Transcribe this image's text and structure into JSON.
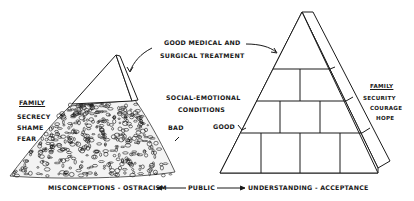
{
  "diagram": {
    "top_label": {
      "line1": "GOOD MEDICAL AND",
      "line2": "SURGICAL TREATMENT"
    },
    "center_label": {
      "line1": "SOCIAL-EMOTIONAL",
      "line2": "CONDITIONS"
    },
    "bad_label": "BAD",
    "good_label": "GOOD",
    "left_family": {
      "heading": "FAMILY",
      "items": [
        "SECRECY",
        "SHAME",
        "FEAR"
      ]
    },
    "right_family": {
      "heading": "FAMILY",
      "items": [
        "SECURITY",
        "COURAGE",
        "HOPE"
      ]
    },
    "bottom": {
      "left": "MISCONCEPTIONS - OSTRACISM",
      "center": "PUBLIC",
      "right": "UNDERSTANDING - ACCEPTANCE"
    },
    "left_figure": "pyramid-tip-on-rubble",
    "right_figure": "brick-pyramid",
    "line_color": "#1a1a1a",
    "background": "#ffffff"
  }
}
